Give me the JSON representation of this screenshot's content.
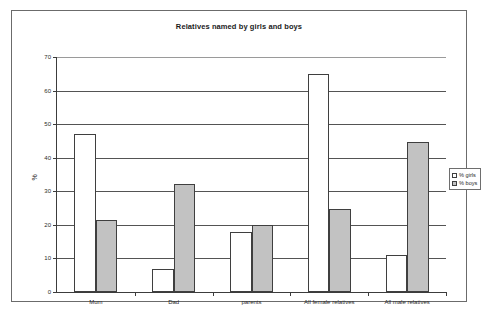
{
  "chart_data": {
    "type": "bar",
    "title": "Relatives named by girls and boys",
    "xlabel": "",
    "ylabel": "%",
    "ylim": [
      0,
      70
    ],
    "yticks": [
      0,
      10,
      20,
      30,
      40,
      50,
      60,
      70
    ],
    "grid": true,
    "legend_position": "right",
    "categories": [
      "Mum",
      "Dad",
      "parents",
      "All female relatives",
      "All male relatives"
    ],
    "series": [
      {
        "name": "% girls",
        "color": "#ffffff",
        "values": [
          47,
          7,
          18,
          65,
          11
        ]
      },
      {
        "name": "% boys",
        "color": "#c2c2c2",
        "values": [
          21.5,
          32.3,
          20,
          24.8,
          44.7
        ]
      }
    ]
  },
  "legend": {
    "items": [
      {
        "label": "% girls"
      },
      {
        "label": "% boys"
      }
    ]
  }
}
